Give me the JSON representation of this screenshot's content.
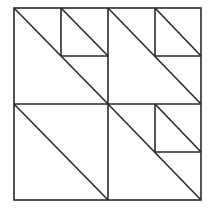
{
  "diagram": {
    "type": "quilt-block-line-drawing",
    "stroke_color": "#2a2a2a",
    "background_color": "#ffffff",
    "outer_square": {
      "x": 14,
      "y": 8,
      "w": 187,
      "h": 192
    },
    "quadrants": [
      {
        "name": "top-left",
        "has_diagonal": true,
        "sub_square": "top-right"
      },
      {
        "name": "top-right",
        "has_diagonal": true,
        "sub_square": "top-right"
      },
      {
        "name": "bottom-left",
        "has_diagonal": true,
        "sub_square": null
      },
      {
        "name": "bottom-right",
        "has_diagonal": true,
        "sub_square": "top-right"
      }
    ]
  }
}
